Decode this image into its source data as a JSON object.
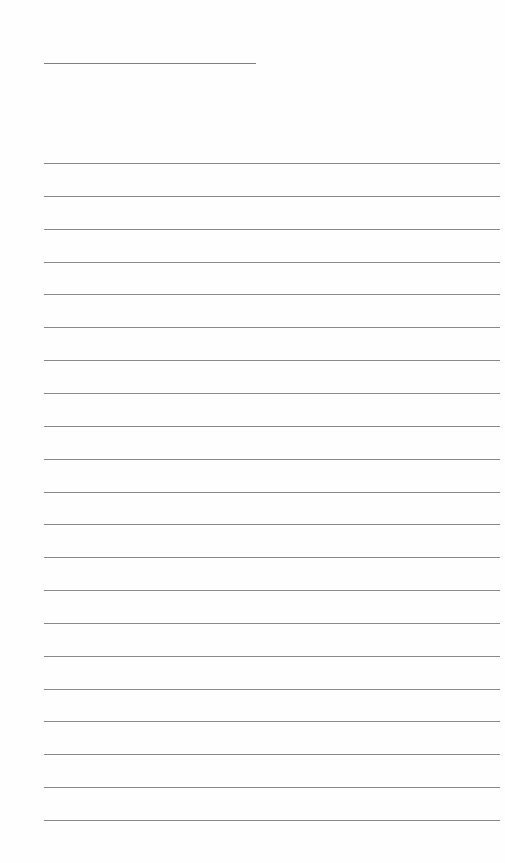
{
  "document": {
    "type": "lined-writing-paper",
    "title_line": {
      "x": 44,
      "y": 63,
      "width": 212,
      "text": ""
    },
    "ruled_lines": {
      "count": 21,
      "first_y": 163,
      "spacing": 32.85,
      "x": 44,
      "width": 456,
      "lines": [
        "",
        "",
        "",
        "",
        "",
        "",
        "",
        "",
        "",
        "",
        "",
        "",
        "",
        "",
        "",
        "",
        "",
        "",
        "",
        "",
        ""
      ]
    },
    "colors": {
      "background": "#fefefe",
      "title_line": "#7f7f7f",
      "ruled_line": "#8a8a8a"
    }
  }
}
